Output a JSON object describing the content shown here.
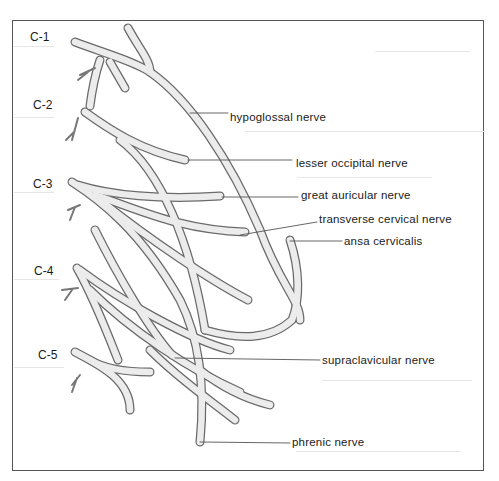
{
  "diagram": {
    "type": "anatomical illustration",
    "levels": [
      {
        "id": "c1",
        "label": "C-1"
      },
      {
        "id": "c2",
        "label": "C-2"
      },
      {
        "id": "c3",
        "label": "C-3"
      },
      {
        "id": "c4",
        "label": "C-4"
      },
      {
        "id": "c5",
        "label": "C-5"
      }
    ],
    "labels": [
      {
        "id": "hypoglossal",
        "text": "hypoglossal nerve"
      },
      {
        "id": "lesser-occipital",
        "text": "lesser occipital nerve"
      },
      {
        "id": "great-auricular",
        "text": "great auricular nerve"
      },
      {
        "id": "transverse-cervical",
        "text": "transverse cervical nerve"
      },
      {
        "id": "ansa-cervicalis",
        "text": "ansa cervicalis"
      },
      {
        "id": "supraclavicular",
        "text": "supraclavicular nerve"
      },
      {
        "id": "phrenic",
        "text": "phrenic nerve"
      }
    ],
    "colors": {
      "nerve_fill": "#ececec",
      "nerve_stroke": "#6a6a6a",
      "leader": "#555555",
      "frame": "#555555"
    }
  }
}
